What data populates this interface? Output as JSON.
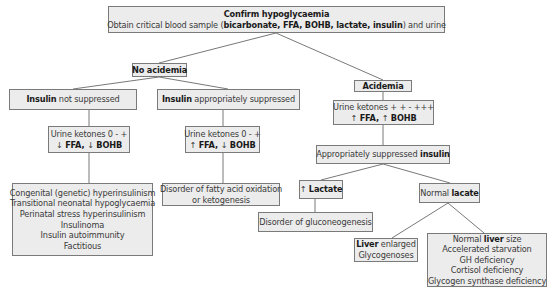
{
  "diagram": {
    "type": "flowchart",
    "colors": {
      "box_fill": "#ececec",
      "box_border": "#7a7a7a",
      "connector": "#555555"
    },
    "root": {
      "title": "Confirm hypoglycaemia",
      "line2": {
        "pre": "Obtain critical blood sample (",
        "bold": "bicarbonate, FFA, BOHB, lactate, insulin",
        "post": ") and urine"
      }
    },
    "no_acidemia": {
      "label": "No acidemia",
      "insulin_not_suppressed": {
        "bold": "Insulin",
        "text": " not suppressed"
      },
      "insulin_suppressed": {
        "bold": "Insulin",
        "text": " appropriately suppressed"
      },
      "left_ketones": {
        "line1": "Urine ketones 0 - +",
        "arrow1": "↓ ",
        "bold1": "FFA",
        "sep": ", ",
        "arrow2": "↓ ",
        "bold2": "BOHB"
      },
      "mid_ketones": {
        "line1": "Urine ketones 0 - +",
        "arrow1": "↑ ",
        "bold1": "FFA",
        "sep": ", ",
        "arrow2": "↓ ",
        "bold2": "BOHB"
      },
      "left_causes": [
        "Congenital (genetic) hyperinsulinism",
        "Transitional neonatal hypoglycaemia",
        "Perinatal stress hyperinsulinism",
        "Insulinoma",
        "Insulin autoimmunity",
        "Factitious"
      ],
      "mid_causes": [
        "Disorder of fatty acid oxidation",
        "or ketogenesis"
      ]
    },
    "acidemia": {
      "label": "Acidemia",
      "ketones": {
        "line1": "Urine ketones + + - +++",
        "arrow1": "↑ ",
        "bold1": "FFA",
        "sep": ", ",
        "arrow2": "↑ ",
        "bold2": "BOHB"
      },
      "suppressed": {
        "text": "Appropriately suppressed ",
        "bold": "insulin"
      },
      "high_lactate": {
        "arrow": "↑ ",
        "bold": "Lactate"
      },
      "high_lactate_cause": "Disorder of gluconeogenesis",
      "normal_lactate": {
        "text": "Normal ",
        "bold": "lacate"
      },
      "liver_enlarged": {
        "bold": "Liver",
        "text": " enlarged",
        "line2": "Glycogenoses"
      },
      "normal_liver": {
        "pre": "Normal ",
        "bold": "liver",
        "post": " size",
        "causes": [
          "Accelerated starvation",
          "GH deficiency",
          "Cortisol deficiency",
          "Glycogen synthase deficiency"
        ]
      }
    }
  }
}
